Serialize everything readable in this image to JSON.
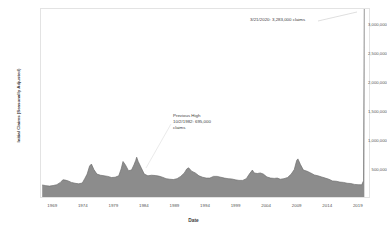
{
  "chart_data": {
    "type": "area",
    "title": "",
    "xlabel": "Date",
    "ylabel": "Initial Claims (Seasonally Adjusted)",
    "xlim": [
      1967,
      2021
    ],
    "ylim": [
      0,
      3283000
    ],
    "grid": false,
    "legend": "none",
    "series_color": "#8c8c8c",
    "line_color": "#6e6e6e",
    "xticks": [
      "1969",
      "1974",
      "1979",
      "1984",
      "1989",
      "1994",
      "1999",
      "2004",
      "2009",
      "2014",
      "2019"
    ],
    "xtick_values": [
      1969,
      1974,
      1979,
      1984,
      1989,
      1994,
      1999,
      2004,
      2009,
      2014,
      2019
    ],
    "yticks": [
      "500,000",
      "1,000,000",
      "1,500,000",
      "2,000,000",
      "2,500,000",
      "3,000,000"
    ],
    "ytick_values": [
      500000,
      1000000,
      1500000,
      2000000,
      2500000,
      3000000
    ],
    "x": [
      1967.2,
      1967.8,
      1968.4,
      1969.0,
      1969.6,
      1970.2,
      1970.6,
      1971.0,
      1971.5,
      1972.0,
      1972.6,
      1973.2,
      1973.8,
      1974.2,
      1974.6,
      1975.0,
      1975.3,
      1975.7,
      1976.2,
      1976.8,
      1977.4,
      1978.0,
      1978.6,
      1979.2,
      1979.8,
      1980.2,
      1980.5,
      1980.9,
      1981.4,
      1981.9,
      1982.3,
      1982.6,
      1982.75,
      1983.0,
      1983.5,
      1984.0,
      1984.6,
      1985.2,
      1985.8,
      1986.4,
      1987.0,
      1987.6,
      1988.2,
      1988.8,
      1989.4,
      1990.0,
      1990.6,
      1991.0,
      1991.3,
      1991.8,
      1992.4,
      1993.0,
      1993.6,
      1994.2,
      1994.8,
      1995.4,
      1996.0,
      1996.6,
      1997.2,
      1997.8,
      1998.4,
      1999.0,
      1999.6,
      2000.2,
      2000.8,
      2001.3,
      2001.8,
      2002.1,
      2002.6,
      2003.1,
      2003.6,
      2004.2,
      2004.8,
      2005.4,
      2005.9,
      2006.4,
      2007.0,
      2007.6,
      2008.2,
      2008.7,
      2009.1,
      2009.3,
      2009.7,
      2010.2,
      2010.8,
      2011.4,
      2012.0,
      2012.6,
      2013.2,
      2013.8,
      2014.4,
      2015.0,
      2015.6,
      2016.2,
      2016.8,
      2017.4,
      2018.0,
      2018.6,
      2019.2,
      2019.8,
      2020.1,
      2020.22,
      2020.23
    ],
    "y": [
      210000,
      198000,
      190000,
      200000,
      215000,
      255000,
      300000,
      295000,
      280000,
      255000,
      240000,
      230000,
      245000,
      320000,
      400000,
      540000,
      575000,
      480000,
      400000,
      380000,
      370000,
      360000,
      340000,
      345000,
      370000,
      490000,
      620000,
      560000,
      460000,
      470000,
      560000,
      640000,
      695000,
      620000,
      510000,
      400000,
      370000,
      380000,
      375000,
      365000,
      345000,
      320000,
      310000,
      305000,
      320000,
      360000,
      420000,
      490000,
      510000,
      450000,
      420000,
      370000,
      345000,
      330000,
      330000,
      360000,
      360000,
      345000,
      330000,
      320000,
      315000,
      300000,
      290000,
      290000,
      320000,
      400000,
      470000,
      420000,
      410000,
      420000,
      400000,
      350000,
      330000,
      325000,
      330000,
      310000,
      320000,
      340000,
      400000,
      480000,
      640000,
      665000,
      570000,
      470000,
      450000,
      420000,
      385000,
      370000,
      350000,
      330000,
      310000,
      280000,
      275000,
      260000,
      255000,
      240000,
      235000,
      220000,
      215000,
      212000,
      282000,
      3283000,
      3283000
    ],
    "annotations": [
      {
        "name": "covid-spike",
        "text": "3/21/2020: 3,283,000 claims",
        "date": "3/21/2020",
        "value": 3283000,
        "value_label": "3,283,000 claims"
      },
      {
        "name": "previous-high",
        "line1": "Previous High",
        "line2": "10/2/1982: 695,000",
        "line3": "claims",
        "date": "10/2/1982",
        "value": 695000,
        "value_label": "695,000 claims"
      }
    ]
  },
  "axis": {
    "y_title": "Initial Claims (Seasonally Adjusted)",
    "x_title": "Date",
    "yticks": [
      {
        "label": "3,000,000",
        "value": 3000000
      },
      {
        "label": "2,500,000",
        "value": 2500000
      },
      {
        "label": "2,000,000",
        "value": 2000000
      },
      {
        "label": "1,500,000",
        "value": 1500000
      },
      {
        "label": "1,000,000",
        "value": 1000000
      },
      {
        "label": "500,000",
        "value": 500000
      }
    ],
    "xticks": [
      {
        "label": "1969",
        "value": 1969
      },
      {
        "label": "1974",
        "value": 1974
      },
      {
        "label": "1979",
        "value": 1979
      },
      {
        "label": "1984",
        "value": 1984
      },
      {
        "label": "1989",
        "value": 1989
      },
      {
        "label": "1994",
        "value": 1994
      },
      {
        "label": "1999",
        "value": 1999
      },
      {
        "label": "2004",
        "value": 2004
      },
      {
        "label": "2009",
        "value": 2009
      },
      {
        "label": "2014",
        "value": 2014
      },
      {
        "label": "2019",
        "value": 2019
      }
    ]
  },
  "annotation_spike": {
    "text": "3/21/2020: 3,283,000 claims"
  },
  "annotation_previous": {
    "line1": "Previous High",
    "line2": "10/2/1982: 695,000",
    "line3": "claims"
  }
}
